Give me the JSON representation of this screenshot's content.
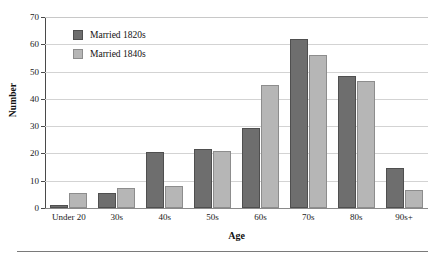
{
  "chart_data": {
    "type": "bar",
    "title": "",
    "xlabel": "Age",
    "ylabel": "Number",
    "categories": [
      "Under 20",
      "30s",
      "40s",
      "50s",
      "60s",
      "70s",
      "80s",
      "90s+"
    ],
    "series": [
      {
        "name": "Married 1820s",
        "color": "#6e6e6e",
        "values": [
          1,
          5.5,
          20.5,
          21.5,
          29.5,
          62,
          48.5,
          14.5
        ]
      },
      {
        "name": "Married 1840s",
        "color": "#b6b6b6",
        "values": [
          5.5,
          7.5,
          8,
          21,
          45,
          56,
          46.5,
          6.5
        ]
      }
    ],
    "ylim": [
      0,
      70
    ],
    "yticks": [
      0,
      10,
      20,
      30,
      40,
      50,
      60,
      70
    ],
    "ytick_labels": [
      "0",
      "10",
      "20",
      "30",
      "40",
      "50",
      "60",
      "70"
    ],
    "grid": true,
    "grid_axis": "y",
    "legend_position": "upper left"
  },
  "legend": {
    "entries": [
      {
        "label": "Married 1820s",
        "swatch": "series-0-swatch"
      },
      {
        "label": "Married 1840s",
        "swatch": "series-1-swatch"
      }
    ]
  }
}
